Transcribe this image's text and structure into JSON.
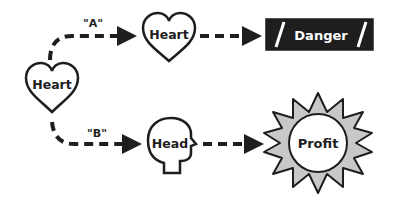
{
  "diagram": {
    "start_node": {
      "label": "Heart",
      "shape": "heart-icon"
    },
    "branches": [
      {
        "edge_label": "\"A\"",
        "middle_node": {
          "label": "Heart",
          "shape": "heart-icon"
        },
        "outcome": {
          "label": "Danger",
          "shape": "dark-banner"
        }
      },
      {
        "edge_label": "\"B\"",
        "middle_node": {
          "label": "Head",
          "shape": "head-profile-icon"
        },
        "outcome": {
          "label": "Profit",
          "shape": "sunburst-icon"
        }
      }
    ],
    "colors": {
      "ink": "#1e1e1e",
      "banner_fill": "#1e1e1e",
      "banner_text": "#ffffff",
      "sun_fill": "#c8c8c8",
      "background": "#ffffff"
    }
  }
}
